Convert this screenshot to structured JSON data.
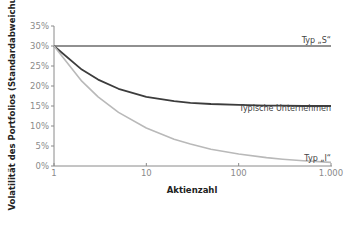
{
  "chart_data": {
    "type": "line",
    "title": "",
    "xlabel": "Aktienzahl",
    "ylabel": "Volatilität des Portfolios (Standardabweichung)",
    "x_scale": "log",
    "xlim": [
      1,
      1000
    ],
    "ylim": [
      0,
      35
    ],
    "x_ticks": [
      1,
      10,
      100,
      1000
    ],
    "x_tick_labels": [
      "1",
      "10",
      "100",
      "1.000"
    ],
    "y_ticks": [
      0,
      5,
      10,
      15,
      20,
      25,
      30,
      35
    ],
    "y_tick_labels": [
      "0%",
      "5%",
      "10%",
      "15%",
      "20%",
      "25%",
      "30%",
      "35%"
    ],
    "grid": false,
    "legend": "inline labels at right end of lines",
    "x": [
      1,
      2,
      3,
      5,
      10,
      20,
      30,
      50,
      100,
      200,
      300,
      500,
      1000
    ],
    "series": [
      {
        "name": "Typ „S“",
        "color": "#6b6b6b",
        "values": [
          30,
          30,
          30,
          30,
          30,
          30,
          30,
          30,
          30,
          30,
          30,
          30,
          30
        ]
      },
      {
        "name": "Typische Unternehmen",
        "color": "#3c3c3c",
        "values": [
          30,
          24.1,
          21.6,
          19.3,
          17.3,
          16.2,
          15.8,
          15.5,
          15.3,
          15.1,
          15.1,
          15.0,
          15.0
        ]
      },
      {
        "name": "Typ „I“",
        "color": "#b9b9b9",
        "values": [
          30,
          21.2,
          17.3,
          13.4,
          9.5,
          6.7,
          5.5,
          4.2,
          3.0,
          2.1,
          1.7,
          1.3,
          0.9
        ]
      }
    ]
  }
}
